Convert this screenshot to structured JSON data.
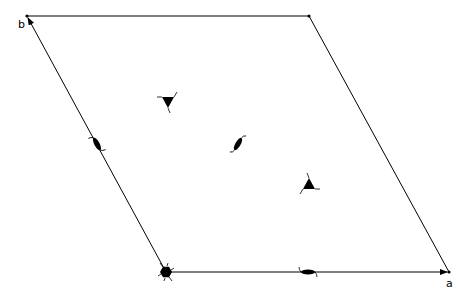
{
  "diagram": {
    "type": "plane-group-symmetry-cell",
    "axes": {
      "a_label": "a",
      "b_label": "b"
    },
    "symbols": [
      {
        "kind": "six-fold-rotation-axis",
        "position": "origin"
      },
      {
        "kind": "three-fold-rotation-axis",
        "position": "1/3,2/3",
        "orientation": "down"
      },
      {
        "kind": "three-fold-rotation-axis",
        "position": "2/3,1/3",
        "orientation": "up"
      },
      {
        "kind": "two-fold-rotation-axis",
        "position": "1/2,1/2"
      },
      {
        "kind": "two-fold-rotation-axis",
        "position": "1/2,0"
      },
      {
        "kind": "two-fold-rotation-axis",
        "position": "0,1/2"
      }
    ],
    "line_color": "#000000"
  }
}
